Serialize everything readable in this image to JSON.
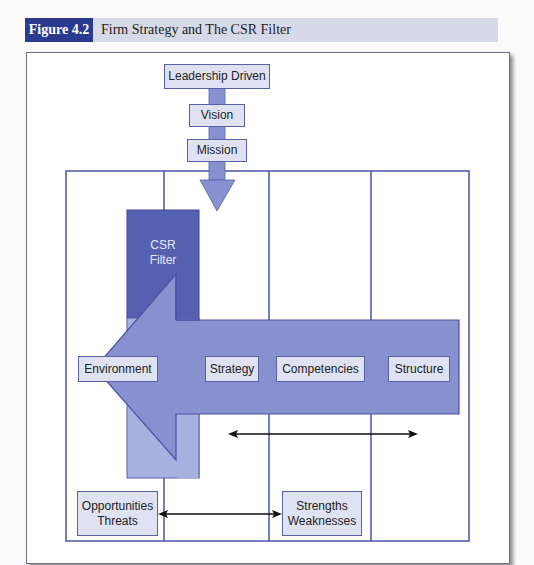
{
  "figure": {
    "number": "Figure 4.2",
    "title": "Firm Strategy and The CSR Filter"
  },
  "diagram": {
    "top_chain": [
      "Leadership Driven",
      "Vision",
      "Mission"
    ],
    "filter": {
      "line1": "CSR",
      "line2": "Filter"
    },
    "arrow_labels": [
      "Environment",
      "Strategy",
      "Competencies",
      "Structure"
    ],
    "bottom_left": {
      "line1": "Opportunities",
      "line2": "Threats"
    },
    "bottom_right": {
      "line1": "Strengths",
      "line2": "Weaknesses"
    },
    "colors": {
      "header_bg": "#d6d9e8",
      "figure_tag": "#2a3a8f",
      "filter_dark": "#5660b0",
      "arrow_fill": "#8791cf",
      "box_fill": "#dfe2f3",
      "line": "#4a52a0"
    }
  }
}
